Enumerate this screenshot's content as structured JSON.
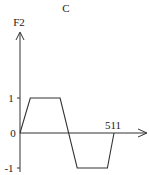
{
  "figure": {
    "panel_label": "C"
  },
  "chart_data": {
    "type": "line",
    "title": "C",
    "xlabel": "",
    "ylabel": "F2",
    "x_tick_labels": [
      "511"
    ],
    "y_tick_labels": [
      "1",
      "0",
      "-1"
    ],
    "y_ticks": [
      1,
      0,
      -1
    ],
    "x_end_label_value": 511,
    "xlim": [
      0,
      511
    ],
    "ylim": [
      -1,
      1
    ],
    "grid": false,
    "series": [
      {
        "name": "F2",
        "x": [
          0,
          56,
          218,
          311,
          475,
          511
        ],
        "y": [
          0,
          1,
          1,
          -1,
          -1,
          0
        ]
      }
    ]
  }
}
